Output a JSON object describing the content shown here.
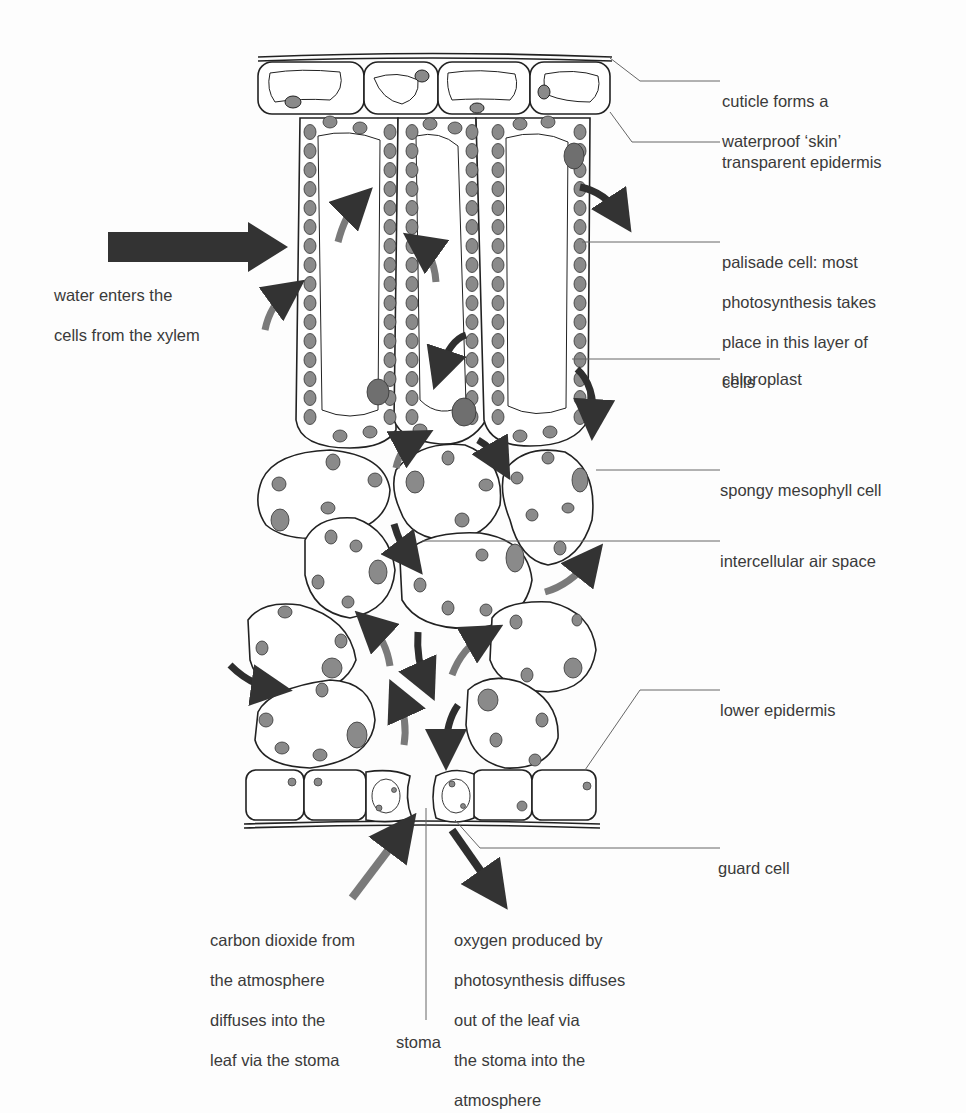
{
  "colors": {
    "outline": "#222222",
    "chloroplast": "#8a8a8a",
    "water_arrow": "#333333",
    "light_arrow": "#7a7a7a",
    "dark_arrow": "#2e2e2e",
    "label_line": "#666666",
    "background": "#fdfdfd"
  },
  "labels": {
    "cuticle": [
      "cuticle forms a",
      "waterproof ‘skin’"
    ],
    "epidermis": [
      "transparent epidermis"
    ],
    "palisade": [
      "palisade cell: most",
      "photosynthesis takes",
      "place in this layer of",
      "cells"
    ],
    "chloroplast": [
      "chloroplast"
    ],
    "spongy": [
      "spongy mesophyll cell"
    ],
    "air_space": [
      "intercellular air space"
    ],
    "lower_epidermis": [
      "lower epidermis"
    ],
    "guard_cell": [
      "guard cell"
    ],
    "water": [
      "water enters the",
      "cells from the xylem"
    ],
    "co2": [
      "carbon dioxide from",
      "the atmosphere",
      "diffuses into the",
      "leaf via the stoma"
    ],
    "oxygen": [
      "oxygen produced by",
      "photosynthesis diffuses",
      "out of the leaf via",
      "the stoma into the",
      "atmosphere"
    ],
    "stoma": [
      "stoma"
    ]
  }
}
